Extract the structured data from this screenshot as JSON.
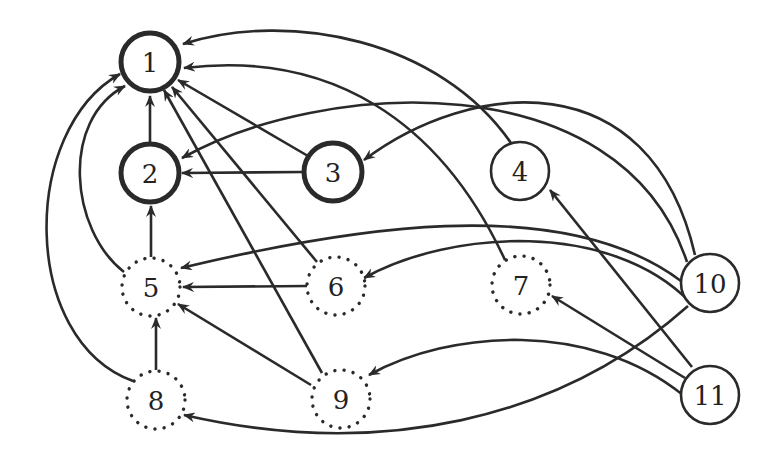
{
  "diagram": {
    "type": "directed-graph",
    "nodes": [
      {
        "id": "1",
        "label": "1",
        "x": 150,
        "y": 62,
        "style": "thick"
      },
      {
        "id": "2",
        "label": "2",
        "x": 150,
        "y": 173,
        "style": "thick"
      },
      {
        "id": "3",
        "label": "3",
        "x": 333,
        "y": 172,
        "style": "thick"
      },
      {
        "id": "4",
        "label": "4",
        "x": 520,
        "y": 171,
        "style": "solid"
      },
      {
        "id": "5",
        "label": "5",
        "x": 151,
        "y": 287,
        "style": "dotted"
      },
      {
        "id": "6",
        "label": "6",
        "x": 336,
        "y": 286,
        "style": "dotted"
      },
      {
        "id": "7",
        "label": "7",
        "x": 521,
        "y": 285,
        "style": "dotted"
      },
      {
        "id": "10",
        "label": "10",
        "x": 710,
        "y": 283,
        "style": "solid"
      },
      {
        "id": "8",
        "label": "8",
        "x": 156,
        "y": 400,
        "style": "dotted"
      },
      {
        "id": "9",
        "label": "9",
        "x": 341,
        "y": 399,
        "style": "dotted"
      },
      {
        "id": "11",
        "label": "11",
        "x": 710,
        "y": 395,
        "style": "solid"
      }
    ],
    "node_radius": 29,
    "edges": [
      {
        "from": "2",
        "to": "1",
        "path": "M150,144 L150,96"
      },
      {
        "from": "3",
        "to": "1",
        "path": "M308,156 L178,80"
      },
      {
        "from": "3",
        "to": "2",
        "path": "M304,172 L182,173"
      },
      {
        "from": "4",
        "to": "1",
        "path": "M511,143 C440,40 290,10 183,44"
      },
      {
        "from": "7",
        "to": "1",
        "path": "M505,260 C440,120 330,50 184,68"
      },
      {
        "from": "6",
        "to": "1",
        "path": "M317,262 L172,87"
      },
      {
        "from": "9",
        "to": "1",
        "path": "M322,373 L164,90"
      },
      {
        "from": "5",
        "to": "1",
        "path": "M124,272 C70,230 60,120 125,86"
      },
      {
        "from": "8",
        "to": "1",
        "path": "M133,381 C20,340 20,130 120,74"
      },
      {
        "from": "5",
        "to": "2",
        "path": "M151,257 L151,206"
      },
      {
        "from": "6",
        "to": "5",
        "path": "M307,286 L183,287"
      },
      {
        "from": "8",
        "to": "5",
        "path": "M156,370 L156,318"
      },
      {
        "from": "9",
        "to": "5",
        "path": "M311,385 L178,304"
      },
      {
        "from": "10",
        "to": "2",
        "path": "M687,262 C620,60 320,80 182,158"
      },
      {
        "from": "10",
        "to": "3",
        "path": "M695,255 C650,60 470,80 364,160"
      },
      {
        "from": "10",
        "to": "5",
        "path": "M681,281 C560,190 340,230 181,268"
      },
      {
        "from": "10",
        "to": "6",
        "path": "M690,302 C610,220 450,230 364,278"
      },
      {
        "from": "10",
        "to": "8",
        "path": "M688,306 C560,420 380,460 184,415"
      },
      {
        "from": "11",
        "to": "4",
        "path": "M692,367 L550,190"
      },
      {
        "from": "11",
        "to": "7",
        "path": "M685,378 L552,296"
      },
      {
        "from": "11",
        "to": "9",
        "path": "M683,395 C590,320 450,330 369,375"
      }
    ]
  }
}
